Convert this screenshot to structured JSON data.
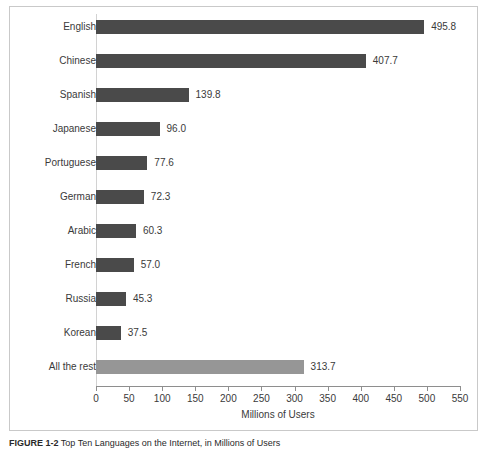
{
  "figure": {
    "caption_label": "FIGURE 1-2",
    "caption_text": "Top Ten Languages on the Internet, in Millions of Users"
  },
  "chart_data": {
    "type": "bar",
    "orientation": "horizontal",
    "title": "",
    "xlabel": "Millions of Users",
    "ylabel": "",
    "xlim": [
      0,
      550
    ],
    "xticks": [
      0,
      50,
      100,
      150,
      200,
      250,
      300,
      350,
      400,
      450,
      500,
      550
    ],
    "grid": false,
    "legend": null,
    "categories": [
      "English",
      "Chinese",
      "Spanish",
      "Japanese",
      "Portuguese",
      "German",
      "Arabic",
      "French",
      "Russia",
      "Korean",
      "All the rest"
    ],
    "values": [
      495.8,
      407.7,
      139.8,
      96.0,
      77.6,
      72.3,
      60.3,
      57.0,
      45.3,
      37.5,
      313.7
    ],
    "value_labels": [
      "495.8",
      "407.7",
      "139.8",
      "96.0",
      "77.6",
      "72.3",
      "60.3",
      "57.0",
      "45.3",
      "37.5",
      "313.7"
    ],
    "bar_colors": [
      "#4a4a4a",
      "#4a4a4a",
      "#4a4a4a",
      "#4a4a4a",
      "#4a4a4a",
      "#4a4a4a",
      "#4a4a4a",
      "#4a4a4a",
      "#4a4a4a",
      "#4a4a4a",
      "#969696"
    ]
  },
  "colors": {
    "bar_primary": "#4a4a4a",
    "bar_secondary": "#969696",
    "axis": "#8e8e8e",
    "text": "#3a3a3a",
    "frame": "#c9c9c9",
    "background": "#ffffff"
  }
}
